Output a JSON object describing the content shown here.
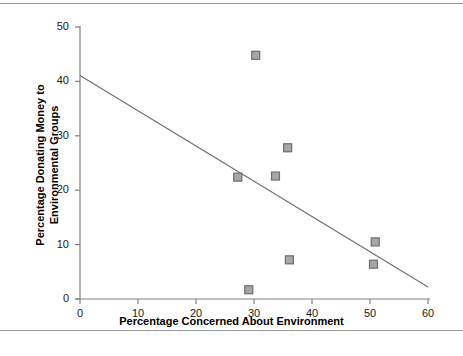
{
  "chart_data": {
    "type": "scatter",
    "title": "",
    "xlabel": "Percentage Concerned About Environment",
    "ylabel_line1": "Percentage Donating Money to",
    "ylabel_line2": "Environmental Groups",
    "xlim": [
      0,
      60
    ],
    "ylim": [
      0,
      50
    ],
    "xticks": [
      0,
      10,
      20,
      30,
      40,
      50,
      60
    ],
    "yticks": [
      0,
      10,
      20,
      30,
      40,
      50
    ],
    "xtick_labels": [
      "0",
      "10",
      "20",
      "30",
      "40",
      "50",
      "60"
    ],
    "ytick_labels": [
      "0",
      "10",
      "20",
      "30",
      "40",
      "50"
    ],
    "grid": false,
    "legend": "none",
    "marker": "square",
    "marker_fill": "#a6a6a6",
    "marker_edge": "#6e6e6e",
    "line_color": "#6e6e6e",
    "axis_color": "#808080",
    "points": [
      {
        "x": 30.3,
        "y": 44.8
      },
      {
        "x": 35.8,
        "y": 27.8
      },
      {
        "x": 33.7,
        "y": 22.6
      },
      {
        "x": 27.2,
        "y": 22.4
      },
      {
        "x": 50.9,
        "y": 10.5
      },
      {
        "x": 36.1,
        "y": 7.2
      },
      {
        "x": 50.6,
        "y": 6.4
      },
      {
        "x": 29.1,
        "y": 1.7
      }
    ],
    "trendline": {
      "name": "linear fit",
      "x0": 0,
      "y0": 41.1,
      "x1": 60,
      "y1": 2.2
    }
  }
}
